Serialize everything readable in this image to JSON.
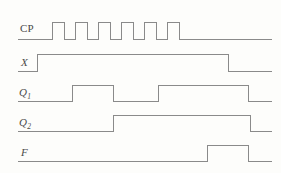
{
  "figure": {
    "type": "timing-diagram",
    "width": 281,
    "height": 173,
    "background_color": "#fdfdfb",
    "line_color": "#8a8a8a",
    "label_color": "#4a4a4a",
    "line_width": 1
  },
  "axis": {
    "x_start": 18,
    "x_end": 272,
    "signal_low_offset": 0,
    "signal_high_offset": -14
  },
  "signals": [
    {
      "name": "CP",
      "label": "CP",
      "italic": false,
      "subscript": "",
      "label_x": 20,
      "label_y": 22,
      "baseline_y": 39,
      "high_y": 22,
      "transitions": [
        52,
        64,
        75,
        87,
        98,
        110,
        121,
        133,
        144,
        156,
        167,
        179
      ],
      "initial_state": 0,
      "pulse_count": 6,
      "period_px": 23,
      "high_width_px": 12
    },
    {
      "name": "X",
      "label": "X",
      "italic": true,
      "subscript": "",
      "label_x": 21,
      "label_y": 56,
      "baseline_y": 71,
      "high_y": 54,
      "transitions": [
        37,
        228
      ],
      "initial_state": 0
    },
    {
      "name": "Q1",
      "label": "Q",
      "italic": true,
      "subscript": "1",
      "label_x": 19,
      "label_y": 86,
      "baseline_y": 101,
      "high_y": 85,
      "transitions": [
        72,
        113,
        158,
        248
      ],
      "initial_state": 0
    },
    {
      "name": "Q2",
      "label": "Q",
      "italic": true,
      "subscript": "2",
      "label_x": 19,
      "label_y": 116,
      "baseline_y": 131,
      "high_y": 115,
      "transitions": [
        113,
        250
      ],
      "initial_state": 0
    },
    {
      "name": "F",
      "label": "F",
      "italic": true,
      "subscript": "",
      "label_x": 21,
      "label_y": 146,
      "baseline_y": 161,
      "high_y": 145,
      "transitions": [
        207,
        248
      ],
      "initial_state": 0
    }
  ]
}
